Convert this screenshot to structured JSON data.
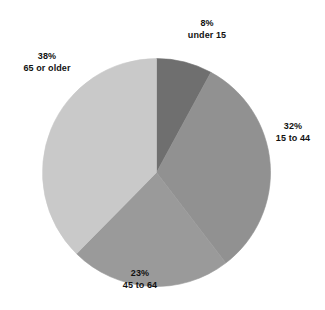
{
  "chart_data": {
    "type": "pie",
    "title": "",
    "categories": [
      "under 15",
      "15 to 44",
      "45 to 64",
      "65 or older"
    ],
    "values": [
      8,
      32,
      23,
      38
    ],
    "value_unit": "%",
    "labels": [
      {
        "pct": "8%",
        "cat": "under 15",
        "color": "#6f6f6f"
      },
      {
        "pct": "32%",
        "cat": "15 to 44",
        "color": "#919191"
      },
      {
        "pct": "23%",
        "cat": "45 to 64",
        "color": "#9a9a9a"
      },
      {
        "pct": "38%",
        "cat": "65 or older",
        "color": "#c9c9c9"
      }
    ],
    "start_angle_deg": 0,
    "direction": "clockwise",
    "legend": "none",
    "grid": false,
    "colors": [
      "#6f6f6f",
      "#919191",
      "#9a9a9a",
      "#c9c9c9"
    ],
    "background": "#ffffff",
    "outline_color": "#b0b0b0"
  },
  "clipped_header": {
    "text": "·  ·  ·   ·  ·   ·    ·     ·   ·  ·   ·"
  },
  "labels": {
    "under_15": {
      "pct": "8%",
      "cat": "under 15"
    },
    "age_15_44": {
      "pct": "32%",
      "cat": "15 to 44"
    },
    "age_45_64": {
      "pct": "23%",
      "cat": "45 to 64"
    },
    "age_65_plus": {
      "pct": "38%",
      "cat": "65 or older"
    }
  }
}
